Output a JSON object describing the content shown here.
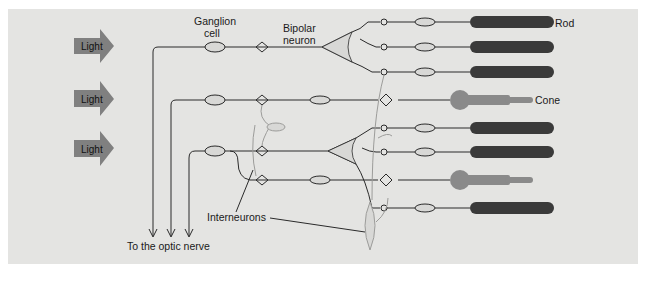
{
  "figure": {
    "background_color": "#e4e4e2",
    "colors": {
      "light_arrow": "#808080",
      "rod": "#3a3a3a",
      "cone": "#8a8a8a",
      "neuron_line": "#2a2a2a",
      "interneuron_line": "#9c9c9a"
    }
  },
  "light_arrows": [
    {
      "label": "Light"
    },
    {
      "label": "Light"
    },
    {
      "label": "Light"
    }
  ],
  "labels": {
    "ganglion_cell_line1": "Ganglion",
    "ganglion_cell_line2": "cell",
    "bipolar_neuron_line1": "Bipolar",
    "bipolar_neuron_line2": "neuron",
    "rod": "Rod",
    "cone": "Cone",
    "interneurons": "Interneurons",
    "optic_nerve": "To the optic nerve"
  },
  "photoreceptors": [
    {
      "type": "rod"
    },
    {
      "type": "rod"
    },
    {
      "type": "rod"
    },
    {
      "type": "cone"
    },
    {
      "type": "rod"
    },
    {
      "type": "rod"
    },
    {
      "type": "cone"
    },
    {
      "type": "rod"
    }
  ]
}
